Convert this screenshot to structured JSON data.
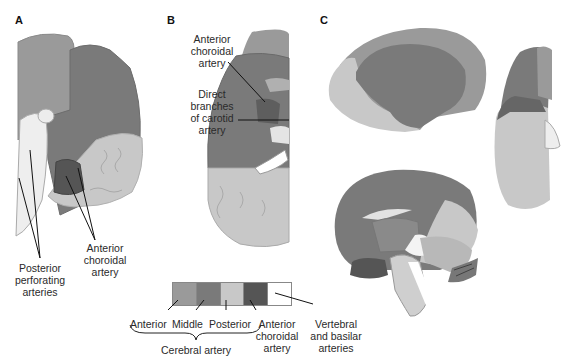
{
  "figure": {
    "panels": [
      {
        "id": "A",
        "letter": "A"
      },
      {
        "id": "B",
        "letter": "B"
      },
      {
        "id": "C",
        "letter": "C"
      }
    ],
    "colors": {
      "anterior": "#9a9a9a",
      "middle": "#7a7a7a",
      "posterior": "#c8c8c8",
      "anterior_choroidal": "#555555",
      "vertebral_basilar": "#ffffff"
    },
    "panel_a": {
      "label_posterior_perforating": [
        "Posterior",
        "perforating",
        "arteries"
      ],
      "label_anterior_choroidal": [
        "Anterior",
        "choroidal",
        "artery"
      ]
    },
    "panel_b": {
      "label_anterior_choroidal": [
        "Anterior",
        "choroidal",
        "artery"
      ],
      "label_direct_branches": [
        "Direct",
        "branches",
        "of carotid",
        "artery"
      ]
    },
    "legend": {
      "items": [
        {
          "label": "Anterior",
          "color": "#9a9a9a"
        },
        {
          "label": "Middle",
          "color": "#7a7a7a"
        },
        {
          "label": "Posterior",
          "color": "#c8c8c8"
        },
        {
          "label": "Anterior choroidal artery",
          "color": "#555555"
        },
        {
          "label": "Vertebral and basilar arteries",
          "color": "#ffffff"
        }
      ],
      "anterior": "Anterior",
      "middle": "Middle",
      "posterior": "Posterior",
      "ant_choroidal": [
        "Anterior",
        "choroidal",
        "artery"
      ],
      "vertebral": [
        "Vertebral",
        "and basilar",
        "arteries"
      ],
      "group_label": "Cerebral artery"
    }
  }
}
